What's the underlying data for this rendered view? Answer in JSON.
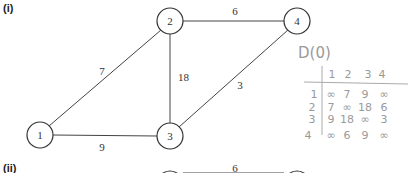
{
  "sections": [
    {
      "label": "(i)"
    },
    {
      "label": "(ii)"
    }
  ],
  "graph_i": {
    "nodes": [
      {
        "id": "1",
        "label": "1",
        "cx": 40,
        "cy": 135
      },
      {
        "id": "2",
        "label": "2",
        "cx": 170,
        "cy": 21
      },
      {
        "id": "3",
        "label": "3",
        "cx": 170,
        "cy": 136
      },
      {
        "id": "4",
        "label": "4",
        "cx": 297,
        "cy": 21
      }
    ],
    "edges": [
      {
        "from": "1",
        "to": "2",
        "weight": "7"
      },
      {
        "from": "2",
        "to": "3",
        "weight": "18"
      },
      {
        "from": "2",
        "to": "4",
        "weight": "6"
      },
      {
        "from": "3",
        "to": "4",
        "weight": "3"
      },
      {
        "from": "1",
        "to": "3",
        "weight": "9"
      }
    ]
  },
  "graph_ii_partial": {
    "edge_weight": "6"
  },
  "handwritten_matrix": {
    "title": "D(0)",
    "col_headers": [
      "1",
      "2",
      "3",
      "4"
    ],
    "row_headers": [
      "1",
      "2",
      "3",
      "4"
    ],
    "rows": [
      [
        "∞",
        "7",
        "9",
        "∞"
      ],
      [
        "7",
        "∞",
        "18",
        "6"
      ],
      [
        "9",
        "18",
        "∞",
        "3"
      ],
      [
        "∞",
        "6",
        "9",
        "∞"
      ]
    ]
  }
}
